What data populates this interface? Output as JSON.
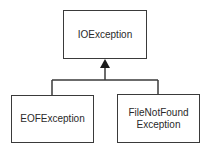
{
  "diagram": {
    "type": "class-hierarchy",
    "parent": {
      "label": "IOException"
    },
    "children": [
      {
        "label": "EOFException"
      },
      {
        "label": "FileNotFound\nException"
      }
    ],
    "relationship": "inheritance",
    "colors": {
      "line": "#3a3a3a",
      "text": "#2a2a2a",
      "background": "#ffffff"
    }
  }
}
